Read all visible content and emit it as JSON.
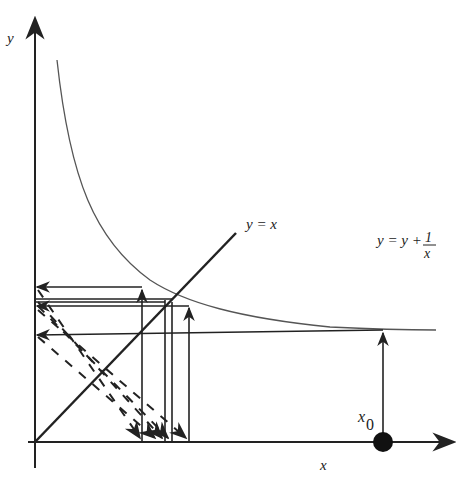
{
  "diagram": {
    "type": "cobweb-iteration",
    "axes": {
      "x_label": "x",
      "y_label": "y"
    },
    "labels": {
      "diagonal": "y = x",
      "curve_lhs": "y  = y +",
      "curve_frac_num": "1",
      "curve_frac_den": "x",
      "start_point": "x",
      "start_point_sub": "0"
    },
    "colors": {
      "ink": "#222222",
      "curve": "#555555",
      "background": "#ffffff"
    }
  }
}
